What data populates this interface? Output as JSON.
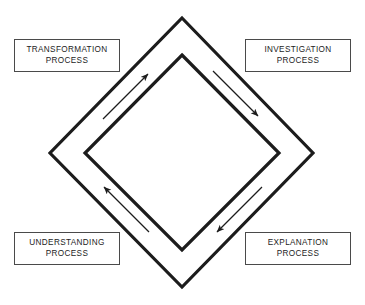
{
  "diagram": {
    "background_color": "#ffffff",
    "stroke_color": "#1c1c1c",
    "box_border_color": "#4a4a4a",
    "shapes": {
      "outer_diamond": "outer-diamond",
      "inner_diamond": "inner-diamond"
    },
    "cycle_direction": "counter-clockwise",
    "boxes": [
      {
        "name": "transformation",
        "line1": "TRANSFORMATION",
        "line2": "PROCESS",
        "position": "top-left"
      },
      {
        "name": "investigation",
        "line1": "INVESTIGATION",
        "line2": "PROCESS",
        "position": "top-right"
      },
      {
        "name": "understanding",
        "line1": "UNDERSTANDING",
        "line2": "PROCESS",
        "position": "bottom-left"
      },
      {
        "name": "explanation",
        "line1": "EXPLANATION",
        "line2": "PROCESS",
        "position": "bottom-right"
      }
    ],
    "arrows": [
      {
        "name": "arrow-upper-left",
        "direction": "up-right",
        "from_side": "lower-left edge",
        "to_side": "top vertex"
      },
      {
        "name": "arrow-upper-right",
        "direction": "down-right",
        "from_side": "top vertex",
        "to_side": "right vertex"
      },
      {
        "name": "arrow-lower-right",
        "direction": "down-left",
        "from_side": "right vertex",
        "to_side": "bottom vertex"
      },
      {
        "name": "arrow-lower-left",
        "direction": "up-left",
        "from_side": "bottom vertex",
        "to_side": "left vertex"
      }
    ]
  }
}
